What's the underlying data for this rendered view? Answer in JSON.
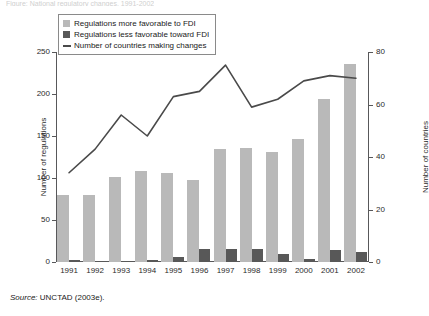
{
  "title": "Figure: National regulatory changes, 1991-2002",
  "source": {
    "label": "Source:",
    "text": "UNCTAD (2003e)."
  },
  "legend": {
    "items": [
      {
        "name": "legend-item-more-favorable",
        "marker": "square-light-swatch",
        "label": "Regulations more favorable to FDI",
        "color": "#b9b9b9"
      },
      {
        "name": "legend-item-less-favorable",
        "marker": "square-dark-swatch",
        "label": "Regulations less favorable toward FDI",
        "color": "#585858"
      },
      {
        "name": "legend-item-countries",
        "marker": "line-swatch",
        "label": "Number of countries making changes",
        "color": "#4a4a4a"
      }
    ]
  },
  "chart_data": {
    "type": "bar",
    "title": "",
    "xlabel": "",
    "ylabel": "Number of regulations",
    "y2label": "Number of countries",
    "categories": [
      "1991",
      "1992",
      "1993",
      "1994",
      "1995",
      "1996",
      "1997",
      "1998",
      "1999",
      "2000",
      "2001",
      "2002"
    ],
    "ylim": [
      0,
      250
    ],
    "yticks": [
      0,
      50,
      100,
      150,
      200,
      250
    ],
    "y2lim": [
      0,
      80
    ],
    "y2ticks": [
      0,
      20,
      40,
      60,
      80
    ],
    "grid": false,
    "legend_position": "top-left",
    "series": [
      {
        "name": "Regulations more favorable to FDI",
        "type": "bar",
        "axis": "left",
        "color": "#b9b9b9",
        "values": [
          80,
          80,
          101,
          108,
          106,
          98,
          135,
          136,
          131,
          147,
          194,
          236
        ]
      },
      {
        "name": "Regulations less favorable toward FDI",
        "type": "bar",
        "axis": "left",
        "color": "#585858",
        "values": [
          2,
          0,
          1,
          2,
          6,
          16,
          16,
          16,
          9,
          3,
          14,
          12
        ]
      },
      {
        "name": "Number of countries making changes",
        "type": "line",
        "axis": "right",
        "color": "#4a4a4a",
        "values": [
          34,
          43,
          56,
          48,
          63,
          65,
          75,
          59,
          62,
          69,
          71,
          70
        ]
      }
    ]
  }
}
